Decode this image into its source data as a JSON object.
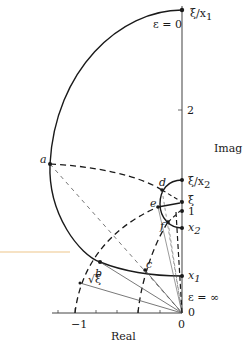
{
  "diagram": {
    "axes": {
      "real_label": "Real",
      "imag_label": "Imag",
      "real_ticks": [
        "−1",
        "0"
      ],
      "imag_ticks": [
        "0",
        "1",
        "2"
      ]
    },
    "point_labels": {
      "xi_over_x1": "ξ/x",
      "xi_over_x1_sub": "1",
      "xi_over_x2": "ξ/x",
      "xi_over_x2_sub": "2",
      "xi": "ξ",
      "one": "1",
      "x2": "x",
      "x2_sub": "2",
      "x1": "x",
      "x1_sub": "1",
      "sqrt_xi": "√ξ"
    },
    "curve_labels": {
      "eps_zero": "ε = 0",
      "eps_inf": "ε = ∞"
    },
    "letters": [
      "a",
      "b",
      "c",
      "d",
      "e",
      "f"
    ],
    "colors": {
      "line": "#1a1a1a",
      "axis": "#888888",
      "thin": "#555555"
    }
  }
}
